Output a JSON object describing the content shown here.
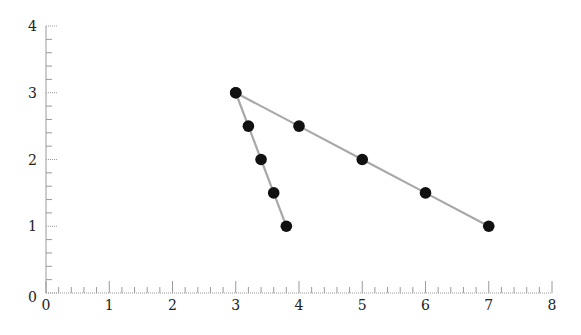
{
  "chart_data": {
    "type": "line",
    "title": "",
    "xlabel": "",
    "ylabel": "",
    "xlim": [
      0,
      8
    ],
    "ylim": [
      0,
      4
    ],
    "x_ticks": [
      0,
      1,
      2,
      3,
      4,
      5,
      6,
      7,
      8
    ],
    "y_ticks": [
      0,
      1,
      2,
      3,
      4
    ],
    "x_minor_step": 0.2,
    "y_minor_step": 0.2,
    "grid": false,
    "legend": null,
    "series": [
      {
        "name": "steep",
        "points": [
          [
            3,
            3
          ],
          [
            3.2,
            2.5
          ],
          [
            3.4,
            2
          ],
          [
            3.6,
            1.5
          ],
          [
            3.8,
            1
          ]
        ]
      },
      {
        "name": "shallow",
        "points": [
          [
            3,
            3
          ],
          [
            4,
            2.5
          ],
          [
            5,
            2
          ],
          [
            6,
            1.5
          ],
          [
            7,
            1
          ]
        ]
      }
    ],
    "style": {
      "line_color": "#a8a8a8",
      "marker_color": "#111111",
      "axis_color": "#9a9a9a"
    }
  }
}
